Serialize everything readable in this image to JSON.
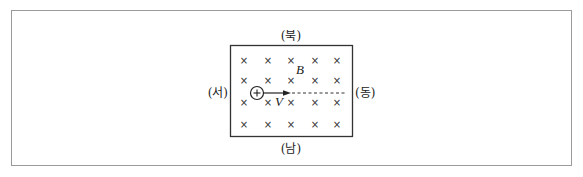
{
  "diagram": {
    "type": "magnetic-field-region",
    "directions": {
      "north": "(북)",
      "south": "(남)",
      "west": "(서)",
      "east": "(동)"
    },
    "field_label": "B",
    "velocity_label": "V",
    "charge_symbol": "+",
    "field_marker": "×",
    "field_direction": "into-page",
    "grid": {
      "rows": 4,
      "cols": 5
    },
    "colors": {
      "frame": "#9a9a9a",
      "box": "#333333",
      "ink": "#222222"
    }
  }
}
